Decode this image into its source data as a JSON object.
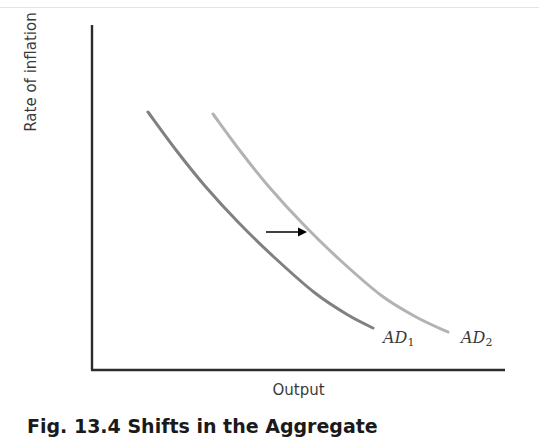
{
  "figure": {
    "caption": "Fig. 13.4 Shifts in the Aggregate",
    "background_color": "#ffffff"
  },
  "chart_data": {
    "type": "line",
    "title": "",
    "xlabel": "Output",
    "ylabel": "Rate of inflation",
    "grid": false,
    "legend_position": "inline-end-labels",
    "axis_color": "#2b2b2b",
    "xlim": [
      0,
      100
    ],
    "ylim": [
      0,
      100
    ],
    "axis_ticks": {
      "x": [],
      "y": []
    },
    "series": [
      {
        "name": "AD1",
        "label": "AD",
        "subscript": "1",
        "color": "#808080",
        "stroke_width": 3,
        "points": [
          [
            148,
            112
          ],
          [
            176,
            150
          ],
          [
            205,
            186
          ],
          [
            238,
            222
          ],
          [
            275,
            258
          ],
          [
            315,
            293
          ],
          [
            348,
            315
          ],
          [
            373,
            328
          ]
        ]
      },
      {
        "name": "AD2",
        "label": "AD",
        "subscript": "2",
        "color": "#b3b3b3",
        "stroke_width": 3,
        "points": [
          [
            213,
            114
          ],
          [
            241,
            152
          ],
          [
            270,
            188
          ],
          [
            303,
            224
          ],
          [
            340,
            260
          ],
          [
            382,
            296
          ],
          [
            418,
            318
          ],
          [
            448,
            332
          ]
        ]
      }
    ],
    "annotations": [
      {
        "type": "arrow",
        "name": "shift-arrow",
        "direction": "right",
        "x1": 266,
        "y1": 232,
        "x2": 307,
        "y2": 232,
        "color": "#000000"
      }
    ]
  }
}
